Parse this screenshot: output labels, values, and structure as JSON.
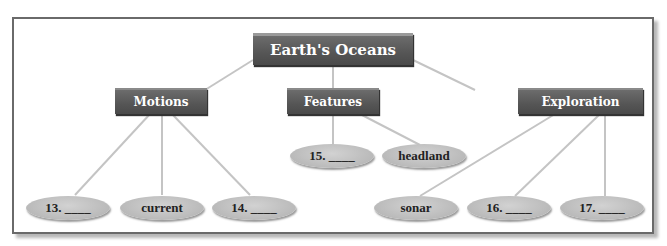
{
  "diagram": {
    "title": "Earth's Oceans",
    "categories": [
      {
        "label": "Motions",
        "items": [
          "13. ____",
          "current",
          "14. ____"
        ]
      },
      {
        "label": "Features",
        "items": [
          "15. ____",
          "headland"
        ]
      },
      {
        "label": "Exploration",
        "items": [
          "sonar",
          "16. ____",
          "17. ____"
        ]
      }
    ]
  }
}
